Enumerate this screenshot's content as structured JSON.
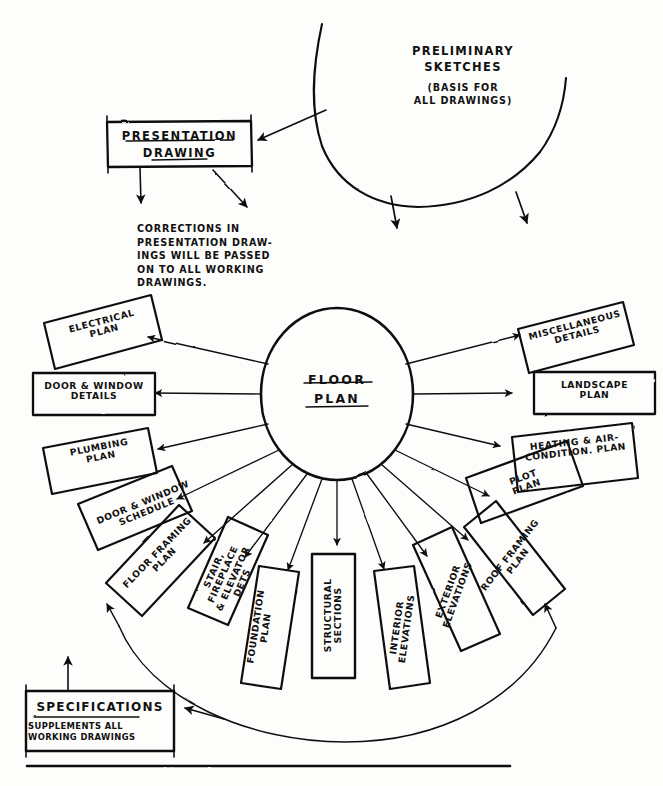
{
  "diagram": {
    "title_hub": "FLOOR\nPLAN",
    "sketch": {
      "title": "PRELIMINARY\nSKETCHES",
      "subtitle": "(BASIS FOR\nALL DRAWINGS)"
    },
    "presentation": {
      "label": "PRESENTATION\nDRAWING"
    },
    "note": "CORRECTIONS IN\nPRESENTATION DRAW-\nINGS WILL BE PASSED\nON TO ALL WORKING\nDRAWINGS.",
    "specifications": {
      "title": "SPECIFICATIONS",
      "subtitle": "SUPPLEMENTS ALL\nWORKING DRAWINGS"
    },
    "footer_caption": "",
    "colors": {
      "ink": "#111111",
      "paper": "#fdfdfc"
    },
    "radial_boxes": [
      {
        "id": "electrical-plan",
        "label": "ELECTRICAL\nPLAN",
        "angle": -168
      },
      {
        "id": "door-window-details",
        "label": "DOOR & WINDOW\nDETAILS",
        "angle": -180
      },
      {
        "id": "plumbing-plan",
        "label": "PLUMBING\nPLAN",
        "angle": 168
      },
      {
        "id": "door-window-schedule",
        "label": "DOOR & WINDOW\nSCHEDULE",
        "angle": 150
      },
      {
        "id": "floor-framing-plan",
        "label": "FLOOR FRAMING\nPLAN",
        "angle": 130
      },
      {
        "id": "stair-fireplace-elevator-dets",
        "label": "STAIR, FIREPLACE\n& ELEVATOR DETS",
        "angle": 113
      },
      {
        "id": "foundation-plan",
        "label": "FOUNDATION\nPLAN",
        "angle": 99
      },
      {
        "id": "structural-sections",
        "label": "STRUCTURAL\nSECTIONS",
        "angle": 90
      },
      {
        "id": "interior-elevations",
        "label": "INTERIOR\nELEVATIONS",
        "angle": 78
      },
      {
        "id": "exterior-elevations",
        "label": "EXTERIOR\nELEVATIONS",
        "angle": 62
      },
      {
        "id": "roof-framing-plan",
        "label": "ROOF FRAMING\nPLAN",
        "angle": 44
      },
      {
        "id": "plot-plan",
        "label": "PLOT\nPLAN",
        "angle": 26
      },
      {
        "id": "heating-air-condition-plan",
        "label": "HEATING & AIR-\nCONDITION. PLAN",
        "angle": 10
      },
      {
        "id": "landscape-plan",
        "label": "LANDSCAPE\nPLAN",
        "angle": 0
      },
      {
        "id": "miscellaneous-details",
        "label": "MISCELLANEOUS\nDETAILS",
        "angle": -14
      }
    ]
  }
}
